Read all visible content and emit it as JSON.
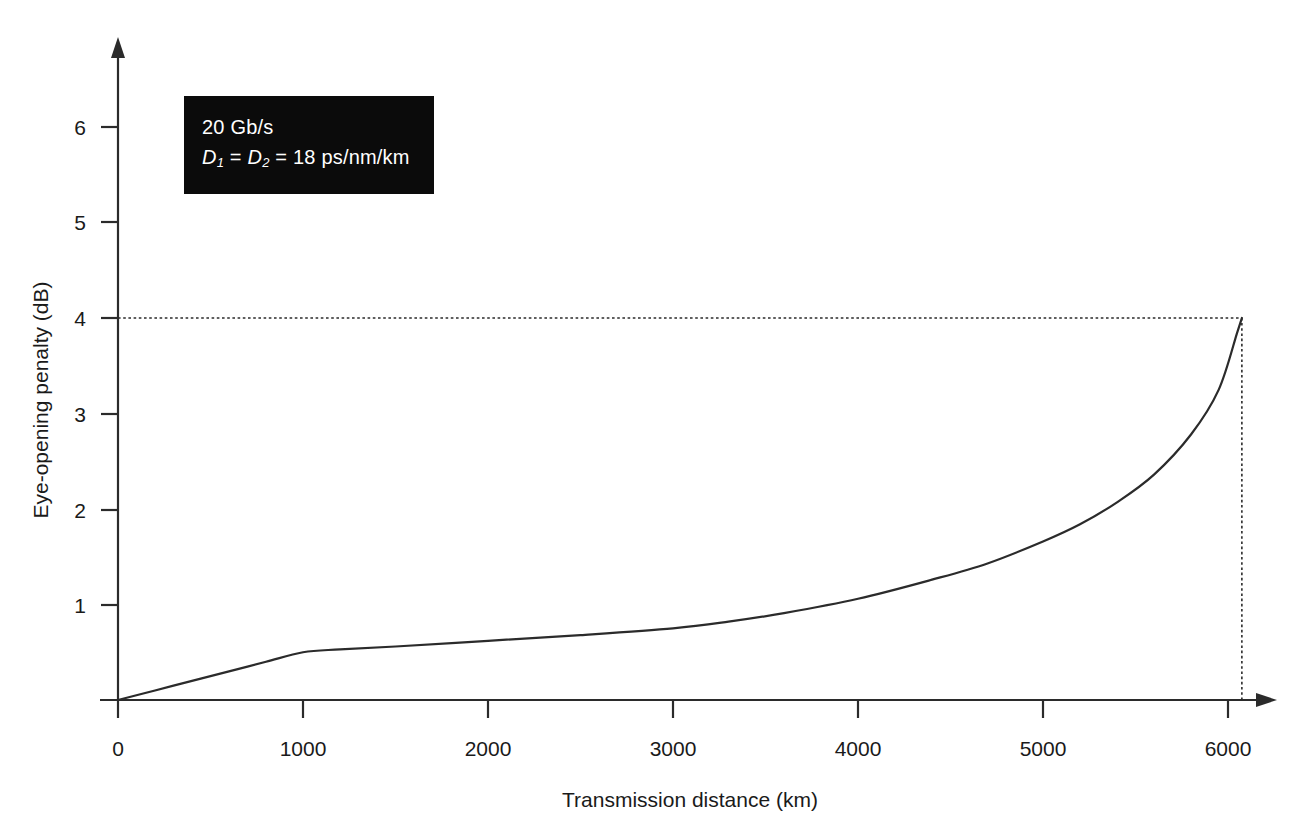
{
  "chart_data": {
    "type": "line",
    "title": "",
    "xlabel": "Transmission distance (km)",
    "ylabel": "Eye-opening penalty (dB)",
    "xlim": [
      0,
      6400
    ],
    "ylim": [
      0,
      6.6
    ],
    "xticks": [
      0,
      1000,
      2000,
      3000,
      4000,
      5000,
      6000
    ],
    "xtick_labels": [
      "0",
      "1000",
      "2000",
      "3000",
      "4000",
      "5000",
      "6000"
    ],
    "yticks": [
      1,
      2,
      3,
      4,
      5,
      6
    ],
    "ytick_labels": [
      "1",
      "2",
      "3",
      "4",
      "5",
      "6"
    ],
    "grid": false,
    "legend_position": "upper-left-inset",
    "series": [
      {
        "name": "Eye-opening penalty vs distance",
        "color": "#2b2b2b",
        "x": [
          0,
          200,
          400,
          600,
          800,
          1000,
          1200,
          1500,
          2000,
          2500,
          3000,
          3300,
          3600,
          4000,
          4400,
          4700,
          5000,
          5200,
          5400,
          5600,
          5800,
          5950,
          6050,
          6075
        ],
        "y": [
          0.0,
          0.1,
          0.2,
          0.3,
          0.4,
          0.5,
          0.53,
          0.56,
          0.62,
          0.68,
          0.75,
          0.82,
          0.91,
          1.06,
          1.26,
          1.43,
          1.66,
          1.84,
          2.07,
          2.36,
          2.78,
          3.25,
          3.85,
          4.0
        ]
      }
    ],
    "annotations": [
      {
        "name": "penalty-4db-guide",
        "type": "dashed-horizontal",
        "y": 4.0,
        "x_from": 0,
        "x_to": 6075
      },
      {
        "name": "max-distance-guide",
        "type": "dashed-vertical",
        "x": 6075,
        "y_from": 0,
        "y_to": 4.0
      }
    ],
    "axis_arrows": {
      "x": true,
      "y": true
    }
  },
  "legend": {
    "bitrate": "20 Gb/s",
    "dispersion_prefix": "D",
    "dispersion_sub1": "1",
    "dispersion_eq1": " = ",
    "dispersion_prefix2": "D",
    "dispersion_sub2": "2",
    "dispersion_value": " = 18 ps/nm/km",
    "background_color": "#0b0b0b",
    "text_color": "#ffffff"
  },
  "axes": {
    "x_title": "Transmission distance (km)",
    "y_title": "Eye-opening penalty (dB)",
    "line_color": "#2b2b2b"
  }
}
